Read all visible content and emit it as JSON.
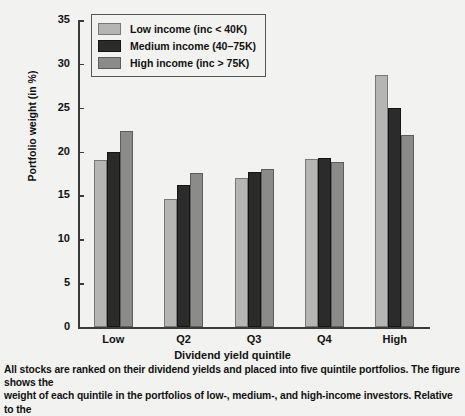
{
  "chart_data": {
    "type": "bar",
    "title": "",
    "xlabel": "Dividend yield quintile",
    "ylabel": "Portfolio weight (in %)",
    "categories": [
      "Low",
      "Q2",
      "Q3",
      "Q4",
      "High"
    ],
    "ylim": [
      0,
      35
    ],
    "yticks": [
      0,
      5,
      10,
      15,
      20,
      25,
      30,
      35
    ],
    "grid": false,
    "legend_position": "top-left-inside",
    "series": [
      {
        "name": "Low income (inc < 40K)",
        "color": "#b5b5b3",
        "values": [
          19.0,
          14.6,
          17.0,
          19.2,
          28.7
        ]
      },
      {
        "name": "Medium income (40–75K)",
        "color": "#2b2b2b",
        "values": [
          19.9,
          16.2,
          17.7,
          19.3,
          25.0
        ]
      },
      {
        "name": "High income (inc > 75K)",
        "color": "#8b8b89",
        "values": [
          22.3,
          17.6,
          18.0,
          18.8,
          21.9
        ]
      }
    ]
  },
  "caption": {
    "line1": "All stocks are ranked on their dividend yields and placed into five quintile portfolios. The figure shows the",
    "line2": "weight of each quintile in the portfolios of low-, medium-, and high-income investors. Relative to the"
  }
}
